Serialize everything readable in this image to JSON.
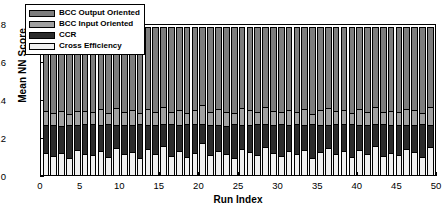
{
  "chart_data": {
    "type": "bar",
    "subtype": "stacked-bar",
    "title": "",
    "xlabel": "Run Index",
    "ylabel": "Mean NN Score",
    "xlim": [
      0,
      50
    ],
    "ylim": [
      0,
      0.8
    ],
    "xticks": [
      0,
      5,
      10,
      15,
      20,
      25,
      30,
      35,
      40,
      45,
      50
    ],
    "yticks": [
      0,
      0.2,
      0.4,
      0.6,
      0.8
    ],
    "ytick_labels": [
      "0",
      "0.2",
      "0.4",
      "0.6",
      "0.8"
    ],
    "xtick_labels": [
      "0",
      "5",
      "10",
      "15",
      "20",
      "25",
      "30",
      "35",
      "40",
      "45",
      "50"
    ],
    "grid": false,
    "legend_position": "upper-left-inside",
    "stack_order_bottom_to_top": [
      "Cross Efficiency",
      "CCR",
      "BCC Input Oriented",
      "BCC Output Oriented"
    ],
    "categories": [
      1,
      2,
      3,
      4,
      5,
      6,
      7,
      8,
      9,
      10,
      11,
      12,
      13,
      14,
      15,
      16,
      17,
      18,
      19,
      20,
      21,
      22,
      23,
      24,
      25,
      26,
      27,
      28,
      29,
      30,
      31,
      32,
      33,
      34,
      35,
      36,
      37,
      38,
      39,
      40,
      41,
      42,
      43,
      44,
      45,
      46,
      47,
      48,
      49,
      50
    ],
    "series": [
      {
        "name": "Cross Efficiency",
        "color": "#f0f0f0",
        "values": [
          0.115,
          0.1,
          0.118,
          0.088,
          0.131,
          0.11,
          0.104,
          0.126,
          0.097,
          0.142,
          0.108,
          0.12,
          0.092,
          0.135,
          0.112,
          0.155,
          0.101,
          0.124,
          0.096,
          0.117,
          0.168,
          0.106,
          0.129,
          0.113,
          0.09,
          0.137,
          0.121,
          0.104,
          0.148,
          0.115,
          0.099,
          0.126,
          0.11,
          0.133,
          0.087,
          0.119,
          0.141,
          0.108,
          0.124,
          0.096,
          0.13,
          0.113,
          0.152,
          0.101,
          0.118,
          0.107,
          0.136,
          0.122,
          0.094,
          0.145
        ]
      },
      {
        "name": "CCR",
        "color": "#2b2b2b",
        "values": [
          0.148,
          0.162,
          0.14,
          0.175,
          0.133,
          0.158,
          0.166,
          0.137,
          0.172,
          0.121,
          0.155,
          0.145,
          0.178,
          0.13,
          0.15,
          0.112,
          0.168,
          0.141,
          0.173,
          0.152,
          0.103,
          0.159,
          0.136,
          0.147,
          0.18,
          0.128,
          0.143,
          0.164,
          0.118,
          0.15,
          0.17,
          0.138,
          0.156,
          0.131,
          0.182,
          0.146,
          0.124,
          0.161,
          0.142,
          0.174,
          0.134,
          0.149,
          0.115,
          0.167,
          0.147,
          0.158,
          0.128,
          0.142,
          0.176,
          0.12
        ]
      },
      {
        "name": "BCC Input Oriented",
        "color": "#a0a0a0",
        "values": [
          0.072,
          0.066,
          0.08,
          0.058,
          0.075,
          0.07,
          0.063,
          0.082,
          0.06,
          0.088,
          0.069,
          0.077,
          0.055,
          0.084,
          0.071,
          0.091,
          0.064,
          0.079,
          0.057,
          0.073,
          0.096,
          0.067,
          0.081,
          0.074,
          0.054,
          0.086,
          0.076,
          0.065,
          0.09,
          0.072,
          0.061,
          0.079,
          0.068,
          0.083,
          0.052,
          0.075,
          0.089,
          0.066,
          0.078,
          0.059,
          0.082,
          0.071,
          0.093,
          0.063,
          0.074,
          0.068,
          0.085,
          0.077,
          0.056,
          0.091
        ]
      },
      {
        "name": "BCC Output Oriented",
        "color": "#7d7d7d",
        "values": [
          0.445,
          0.452,
          0.442,
          0.459,
          0.441,
          0.442,
          0.447,
          0.435,
          0.451,
          0.429,
          0.448,
          0.438,
          0.455,
          0.431,
          0.447,
          0.422,
          0.447,
          0.436,
          0.454,
          0.438,
          0.413,
          0.448,
          0.434,
          0.446,
          0.456,
          0.429,
          0.44,
          0.447,
          0.424,
          0.443,
          0.45,
          0.437,
          0.446,
          0.433,
          0.459,
          0.44,
          0.426,
          0.445,
          0.436,
          0.451,
          0.434,
          0.447,
          0.42,
          0.449,
          0.441,
          0.447,
          0.431,
          0.439,
          0.454,
          0.424
        ]
      }
    ],
    "stack_totals_approx": 0.78,
    "legend_entries": [
      {
        "label": "BCC Output Oriented",
        "color": "#7d7d7d"
      },
      {
        "label": "BCC Input Oriented",
        "color": "#a0a0a0"
      },
      {
        "label": "CCR",
        "color": "#2b2b2b"
      },
      {
        "label": "Cross Efficiency",
        "color": "#f0f0f0"
      }
    ]
  }
}
